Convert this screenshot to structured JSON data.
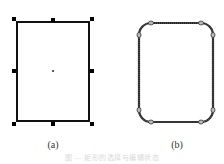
{
  "figure": {
    "panels": [
      {
        "id": "a",
        "label": "(a)",
        "shape": "rectangle-with-selection-handles",
        "rect": {
          "x": 17,
          "y": 22,
          "width": 72,
          "height": 99
        },
        "handles": [
          {
            "x": 14,
            "y": 19
          },
          {
            "x": 53,
            "y": 20
          },
          {
            "x": 92,
            "y": 19
          },
          {
            "x": 14,
            "y": 71
          },
          {
            "x": 92,
            "y": 71
          },
          {
            "x": 14,
            "y": 124
          },
          {
            "x": 53,
            "y": 124
          },
          {
            "x": 92,
            "y": 124
          }
        ],
        "center": {
          "x": 53,
          "y": 71
        }
      },
      {
        "id": "b",
        "label": "(b)",
        "shape": "rounded-rectangle-with-nodes",
        "rect": {
          "x": 139,
          "y": 23,
          "width": 74,
          "height": 99,
          "radius": 12
        },
        "nodes": [
          {
            "x": 151,
            "y": 23
          },
          {
            "x": 201,
            "y": 23
          },
          {
            "x": 139,
            "y": 35
          },
          {
            "x": 213,
            "y": 35
          },
          {
            "x": 139,
            "y": 110
          },
          {
            "x": 213,
            "y": 110
          },
          {
            "x": 151,
            "y": 122
          },
          {
            "x": 201,
            "y": 122
          }
        ]
      }
    ],
    "caption": "图 — 矩形的选择与编辑状态"
  },
  "colors": {
    "stroke": "#111111",
    "handle": "#000000",
    "node_fill": "#bbbbbb",
    "caption": "#d8d8d8"
  }
}
